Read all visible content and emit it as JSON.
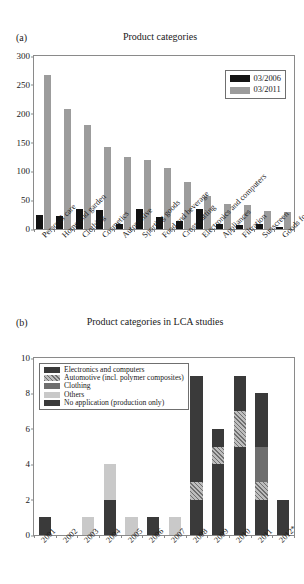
{
  "figures": {
    "a": {
      "panel_label": "(a)",
      "title": "Product categories"
    },
    "b": {
      "panel_label": "(b)",
      "title": "Product categories in LCA studies"
    }
  },
  "chart_data": [
    {
      "id": "a",
      "type": "bar",
      "title": "Product categories",
      "panel": "(a)",
      "xlabel": "",
      "ylabel": "",
      "ylim": [
        0,
        300
      ],
      "yticks": [
        0,
        50,
        100,
        150,
        200,
        250,
        300
      ],
      "grid": false,
      "legend_position": "top-right",
      "categories": [
        "Personal care",
        "Home and garden",
        "Clothing",
        "Cosmetics",
        "Automotive",
        "Sporting goods",
        "Food and beverage",
        "Cross cutting",
        "Electronics and computers",
        "Appliances",
        "Filtration",
        "Sunscreen",
        "Goods for children"
      ],
      "series": [
        {
          "name": "03/2006",
          "color": "#131313",
          "values": [
            25,
            23,
            35,
            33,
            9,
            34,
            21,
            14,
            34,
            9,
            7,
            9,
            3
          ]
        },
        {
          "name": "03/2011",
          "color": "#9c9c9c",
          "values": [
            267,
            208,
            181,
            142,
            125,
            119,
            105,
            81,
            58,
            44,
            42,
            32,
            29
          ]
        }
      ]
    },
    {
      "id": "b",
      "type": "bar",
      "subtype": "stacked",
      "title": "Product categories in LCA studies",
      "panel": "(b)",
      "xlabel": "",
      "ylabel": "",
      "ylim": [
        0,
        10
      ],
      "yticks": [
        0,
        2,
        4,
        6,
        8,
        10
      ],
      "grid": false,
      "legend_position": "top-left",
      "categories": [
        "2001",
        "2002",
        "2003",
        "2004",
        "2005",
        "2006",
        "2007",
        "2008",
        "2009",
        "2010",
        "2011",
        "2012*"
      ],
      "series": [
        {
          "name": "No application (production only)",
          "fill": "dark",
          "color": "#3a3a3a",
          "values": [
            1,
            0,
            0,
            2,
            0,
            1,
            0,
            2,
            4,
            5,
            2,
            2
          ]
        },
        {
          "name": "Others",
          "fill": "light",
          "color": "#c9c9c9",
          "values": [
            0,
            0,
            1,
            2,
            1,
            0,
            1,
            0,
            0,
            0,
            0,
            0
          ]
        },
        {
          "name": "Automotive (incl. polymer composites)",
          "fill": "hatch",
          "color": "#bdbdbd",
          "values": [
            0,
            0,
            0,
            0,
            0,
            0,
            0,
            1,
            1,
            2,
            1,
            0
          ]
        },
        {
          "name": "Clothing",
          "fill": "mid",
          "color": "#6e6e6e",
          "values": [
            0,
            0,
            0,
            0,
            0,
            0,
            0,
            0,
            0,
            0,
            2,
            0
          ]
        },
        {
          "name": "Electronics and computers",
          "fill": "dark",
          "color": "#3a3a3a",
          "values": [
            0,
            0,
            0,
            0,
            0,
            0,
            0,
            6,
            1,
            2,
            3,
            0
          ]
        }
      ],
      "totals": [
        1,
        0,
        1,
        4,
        1,
        1,
        1,
        9,
        6,
        9,
        8,
        2
      ]
    }
  ],
  "legend_a": {
    "items": [
      {
        "label": "03/2006",
        "key": "swatch-black"
      },
      {
        "label": "03/2011",
        "key": "swatch-gray"
      }
    ]
  },
  "legend_b": {
    "items": [
      {
        "label": "Electronics and computers",
        "key": "swatch-dark"
      },
      {
        "label": "Automotive (incl. polymer composites)",
        "key": "swatch-hatch"
      },
      {
        "label": "Clothing",
        "key": "swatch-mid"
      },
      {
        "label": "Others",
        "key": "swatch-light"
      },
      {
        "label": "No application (production only)",
        "key": "swatch-dark"
      }
    ]
  }
}
